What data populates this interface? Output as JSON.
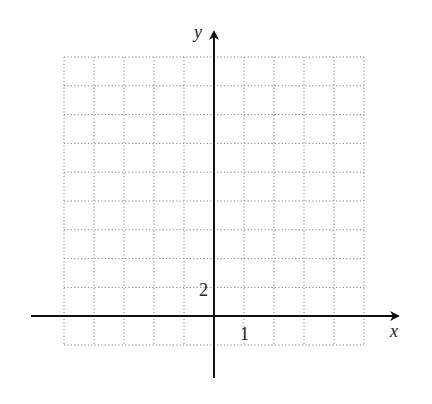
{
  "graph": {
    "axes": {
      "x_label": "x",
      "y_label": "y",
      "x_tick_label": "1",
      "y_tick_label": "2",
      "x_unit": 1,
      "y_unit": 2
    },
    "grid": {
      "columns": 10,
      "rows": 10,
      "columns_left_of_y_axis": 5,
      "rows_below_x_axis": 1,
      "style": "dotted",
      "color": "#888888"
    },
    "axis_color": "#111111",
    "x_range": [
      -5,
      5
    ],
    "y_range": [
      -2,
      18
    ]
  }
}
